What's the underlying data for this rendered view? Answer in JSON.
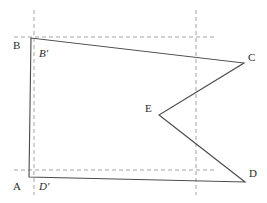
{
  "figure": {
    "type": "geometry-diagram",
    "canvas": {
      "width": 267,
      "height": 203,
      "background": "#ffffff"
    },
    "style": {
      "solid_stroke": "#4a4a4a",
      "dashed_stroke": "#9a9a9a",
      "label_color": "#2b2b2b",
      "solid_width": 1.1,
      "dashed_width": 0.9,
      "dash_pattern": "4 3",
      "label_font_size": "11px"
    },
    "points": [
      {
        "id": "A",
        "label": "A",
        "x": 29,
        "y": 177,
        "label_x": 13,
        "label_y": 181,
        "italic": false
      },
      {
        "id": "B",
        "label": "B",
        "x": 31,
        "y": 38,
        "label_x": 13,
        "label_y": 40,
        "italic": false
      },
      {
        "id": "C",
        "label": "C",
        "x": 244,
        "y": 63,
        "label_x": 248,
        "label_y": 52,
        "italic": false
      },
      {
        "id": "D",
        "label": "D",
        "x": 245,
        "y": 182,
        "label_x": 249,
        "label_y": 168,
        "italic": false
      },
      {
        "id": "E",
        "label": "E",
        "x": 159,
        "y": 115,
        "label_x": 145,
        "label_y": 103,
        "italic": false
      },
      {
        "id": "Bp",
        "label": "B′",
        "x": 34,
        "y": 38,
        "label_x": 39,
        "label_y": 48,
        "italic": true
      },
      {
        "id": "Dp",
        "label": "D′",
        "x": 34,
        "y": 177,
        "label_x": 39,
        "label_y": 181,
        "italic": true
      }
    ],
    "polygon": {
      "name": "polygon-abced",
      "vertex_order": [
        "A",
        "B",
        "C",
        "E",
        "D"
      ],
      "closed": true,
      "points_string": "29,177 31,38 244,63 159,115 245,182"
    },
    "dashed_lines": [
      {
        "name": "vertical-guide-left",
        "x1": 34,
        "y1": 10,
        "x2": 34,
        "y2": 195
      },
      {
        "name": "vertical-guide-right",
        "x1": 196,
        "y1": 10,
        "x2": 196,
        "y2": 195
      },
      {
        "name": "horizontal-guide-top",
        "x1": 14,
        "y1": 37,
        "x2": 215,
        "y2": 37
      },
      {
        "name": "horizontal-guide-bottom",
        "x1": 14,
        "y1": 170,
        "x2": 215,
        "y2": 170
      }
    ],
    "edges": [
      {
        "name": "edge-ab",
        "from": "A",
        "to": "B"
      },
      {
        "name": "edge-bc",
        "from": "B",
        "to": "C"
      },
      {
        "name": "edge-ce",
        "from": "C",
        "to": "E"
      },
      {
        "name": "edge-ed",
        "from": "E",
        "to": "D"
      },
      {
        "name": "edge-da",
        "from": "D",
        "to": "A"
      }
    ]
  }
}
